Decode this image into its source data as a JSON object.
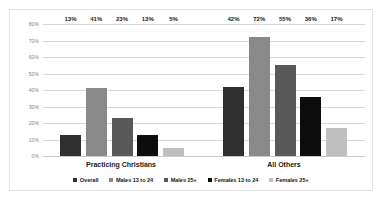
{
  "chart_data": {
    "type": "bar",
    "title": "",
    "xlabel": "",
    "ylabel": "",
    "ylim": [
      0,
      80
    ],
    "grid": true,
    "legend_position": "bottom",
    "categories": [
      "Practicing Christians",
      "All Others"
    ],
    "ytick_labels": [
      "80%",
      "70%",
      "60%",
      "50%",
      "40%",
      "30%",
      "20%",
      "10%",
      "0%"
    ],
    "ytick_values": [
      80,
      70,
      60,
      50,
      40,
      30,
      20,
      10,
      0
    ],
    "series": [
      {
        "name": "Overall",
        "color": "#2e2e2e",
        "values": [
          13,
          42
        ],
        "labels": [
          "13%",
          "42%"
        ]
      },
      {
        "name": "Males 13 to 24",
        "color": "#898989",
        "values": [
          41,
          72
        ],
        "labels": [
          "41%",
          "72%"
        ]
      },
      {
        "name": "Males 25+",
        "color": "#585858",
        "values": [
          23,
          55
        ],
        "labels": [
          "23%",
          "55%"
        ]
      },
      {
        "name": "Females 13 to 24",
        "color": "#0d0d0d",
        "values": [
          13,
          36
        ],
        "labels": [
          "13%",
          "36%"
        ]
      },
      {
        "name": "Females 25+",
        "color": "#bfbfbf",
        "values": [
          5,
          17
        ],
        "labels": [
          "5%",
          "17%"
        ]
      }
    ]
  }
}
